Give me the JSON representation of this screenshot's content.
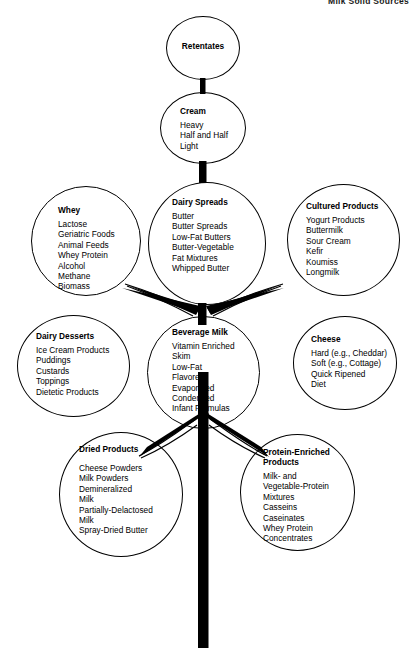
{
  "page": {
    "header_label": "Milk Solid Sources",
    "diagram_title": "Milk Products Tree",
    "background_color": "#ffffff",
    "line_color": "#000000"
  },
  "nodes": [
    {
      "id": "retentates",
      "title": "Retentates",
      "items": "",
      "title_align": "center"
    },
    {
      "id": "cream",
      "title": "Cream",
      "items": "Heavy\nHalf and Half\nLight",
      "title_align": "left"
    },
    {
      "id": "dairy-spreads",
      "title": "Dairy Spreads",
      "items": "Butter\nButter Spreads\nLow-Fat Butters\nButter-Vegetable\n   Fat Mixtures\nWhipped Butter",
      "title_align": "left"
    },
    {
      "id": "whey",
      "title": "Whey",
      "items": "Lactose\nGeriatric Foods\nAnimal Feeds\nWhey Protein\nAlcohol\nMethane\nBiomass",
      "title_align": "left"
    },
    {
      "id": "cultured-products",
      "title": "Cultured Products",
      "items": "Yogurt Products\nButtermilk\nSour Cream\nKefir\nKoumiss\nLongmilk",
      "title_align": "left"
    },
    {
      "id": "beverage-milk",
      "title": "Beverage Milk",
      "items": "Vitamin Enriched\nSkim\nLow-Fat\nFlavored\nEvaporated\nCondensed\nInfant Formulas",
      "title_align": "left"
    },
    {
      "id": "dairy-desserts",
      "title": "Dairy Desserts",
      "items": "Ice Cream Products\nPuddings\nCustards\nToppings\nDietetic Products",
      "title_align": "left"
    },
    {
      "id": "cheese",
      "title": "Cheese",
      "items": "Hard (e.g., Cheddar)\nSoft (e.g., Cottage)\nQuick Ripened\nDiet",
      "title_align": "left"
    },
    {
      "id": "dried-products",
      "title": "Dried Products",
      "items": "Cheese Powders\nMilk Powders\nDemineralized\n   Milk\nPartially-Delactosed\n   Milk\nSpray-Dried Butter",
      "title_align": "left"
    },
    {
      "id": "protein-enriched-products",
      "title": "Protein-Enriched\nProducts",
      "items": "Milk- and\n   Vegetable-Protein\n   Mixtures\nCasseins\nCaseinates\nWhey Protein\n   Concentrates",
      "title_align": "left"
    }
  ]
}
